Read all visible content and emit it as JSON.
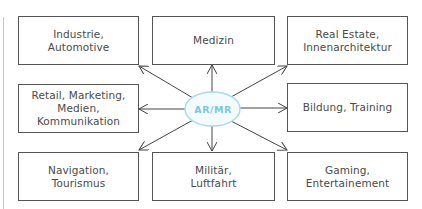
{
  "diagram": {
    "hub": {
      "label": "AR/MR",
      "fill": "#f4fbfd",
      "stroke": "#a9dceb",
      "text_color": "#7cc7dc"
    },
    "boxes": [
      {
        "id": "industrie",
        "label": "Industrie,\nAutomotive"
      },
      {
        "id": "medizin",
        "label": "Medizin"
      },
      {
        "id": "real-estate",
        "label": "Real Estate,\nInnenarchitektur"
      },
      {
        "id": "retail",
        "label": "Retail, Marketing,\nMedien,\nKommunikation"
      },
      {
        "id": "bildung",
        "label": "Bildung, Training"
      },
      {
        "id": "navigation",
        "label": "Navigation,\nTourismus"
      },
      {
        "id": "militaer",
        "label": "Militär,\nLuftfahrt"
      },
      {
        "id": "gaming",
        "label": "Gaming,\nEntertainement"
      }
    ],
    "colors": {
      "box_border": "#555555",
      "text": "#4a4a4a",
      "arrow": "#444444"
    }
  }
}
